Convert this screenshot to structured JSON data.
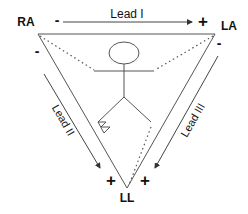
{
  "diagram": {
    "electrodes": {
      "ra": "RA",
      "la": "LA",
      "ll": "LL"
    },
    "leads": {
      "lead1": "Lead I",
      "lead2": "Lead II",
      "lead3": "Lead III"
    },
    "polarity": {
      "lead1_neg": "-",
      "lead1_pos": "+",
      "lead2_neg": "-",
      "lead2_pos": "+",
      "lead3_neg": "-",
      "lead3_pos": "+"
    },
    "colors": {
      "line": "#555555",
      "text": "#111111",
      "background": "#ffffff"
    }
  }
}
